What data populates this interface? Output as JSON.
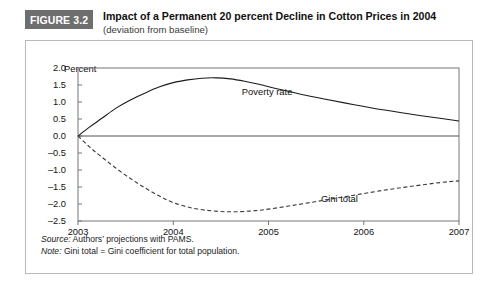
{
  "figure": {
    "badge": "FIGURE 3.2",
    "title": "Impact of a Permanent 20 percent Decline in Cotton Prices in 2004",
    "subtitle": "(deviation from baseline)",
    "badge_color": "#6e6e6e",
    "border_color": "#b8b8b8"
  },
  "footnotes": {
    "source_lead": "Source:",
    "source_text": " Authors’ projections with PAMS.",
    "note_lead": "Note:",
    "note_text": " Gini total = Gini coefficient for total population."
  },
  "chart_data": {
    "type": "line",
    "title": "Impact of a Permanent 20 percent Decline in Cotton Prices in 2004",
    "subtitle": "(deviation from baseline)",
    "xlabel": "",
    "ylabel": "Percent",
    "ylim": [
      -2.5,
      2.0
    ],
    "xlim": [
      2003,
      2007
    ],
    "ytick_labels": [
      "2.0",
      "1.5",
      "1.0",
      "0.5",
      "0.0",
      "-0.5",
      "-1.0",
      "-1.5",
      "-2.0",
      "-2.5"
    ],
    "ytick_values": [
      2.0,
      1.5,
      1.0,
      0.5,
      0.0,
      -0.5,
      -1.0,
      -1.5,
      -2.0,
      -2.5
    ],
    "xtick_labels": [
      "2003",
      "2004",
      "2005",
      "2006",
      "2007"
    ],
    "xtick_values": [
      2003,
      2004,
      2005,
      2006,
      2007
    ],
    "grid": false,
    "zero_line": true,
    "legend_position": "inline-annotation",
    "series": [
      {
        "name": "Poverty rate",
        "style": "solid",
        "color": "#1a1a1a",
        "label_x": 2004.72,
        "label_y": 1.28,
        "x": [
          2003.0,
          2003.12,
          2003.25,
          2003.4,
          2003.55,
          2003.7,
          2003.85,
          2004.0,
          2004.15,
          2004.3,
          2004.45,
          2004.6,
          2004.75,
          2004.9,
          2005.1,
          2005.35,
          2005.6,
          2005.9,
          2006.2,
          2006.5,
          2006.8,
          2007.0
        ],
        "y": [
          0.0,
          0.26,
          0.52,
          0.82,
          1.06,
          1.26,
          1.44,
          1.57,
          1.65,
          1.7,
          1.71,
          1.68,
          1.61,
          1.52,
          1.38,
          1.22,
          1.08,
          0.92,
          0.77,
          0.64,
          0.52,
          0.44
        ]
      },
      {
        "name": "Gini total",
        "style": "dashed",
        "color": "#3a3a3a",
        "label_x": 2005.55,
        "label_y": -1.86,
        "x": [
          2003.0,
          2003.12,
          2003.25,
          2003.4,
          2003.55,
          2003.7,
          2003.85,
          2004.0,
          2004.2,
          2004.4,
          2004.6,
          2004.8,
          2005.0,
          2005.3,
          2005.6,
          2005.9,
          2006.2,
          2006.5,
          2006.8,
          2007.0
        ],
        "y": [
          0.0,
          -0.32,
          -0.62,
          -0.95,
          -1.25,
          -1.52,
          -1.76,
          -1.96,
          -2.12,
          -2.2,
          -2.23,
          -2.21,
          -2.15,
          -2.02,
          -1.88,
          -1.74,
          -1.6,
          -1.48,
          -1.37,
          -1.32
        ]
      }
    ]
  }
}
